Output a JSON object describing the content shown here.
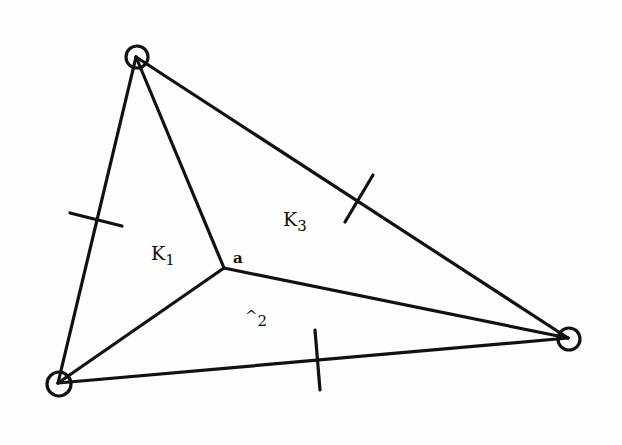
{
  "diagram": {
    "type": "triangulation",
    "vertices": [
      {
        "id": "top",
        "x": 136,
        "y": 57,
        "circled": true
      },
      {
        "id": "bottom-left",
        "x": 58,
        "y": 383,
        "circled": true
      },
      {
        "id": "right",
        "x": 568,
        "y": 338,
        "circled": true
      },
      {
        "id": "a",
        "x": 224,
        "y": 268,
        "circled": false,
        "label": "a"
      }
    ],
    "edges": [
      [
        "top",
        "bottom-left"
      ],
      [
        "top",
        "right"
      ],
      [
        "bottom-left",
        "right"
      ],
      [
        "top",
        "a"
      ],
      [
        "bottom-left",
        "a"
      ],
      [
        "right",
        "a"
      ]
    ],
    "edge_marks": [
      {
        "edge": [
          "top",
          "bottom-left"
        ],
        "x": 100,
        "y": 220
      },
      {
        "edge": [
          "top",
          "right"
        ],
        "x": 359,
        "y": 199
      },
      {
        "edge": [
          "bottom-left",
          "right"
        ],
        "x": 318,
        "y": 361
      }
    ],
    "regions": [
      {
        "name": "K1",
        "base": "K",
        "sub": "1"
      },
      {
        "name": "K2",
        "base": "^",
        "sub": "2"
      },
      {
        "name": "K3",
        "base": "K",
        "sub": "3"
      }
    ],
    "point_label": "a"
  }
}
